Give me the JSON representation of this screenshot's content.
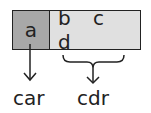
{
  "cells": {
    "car_cell": "a",
    "cdr_cell": "b c d"
  },
  "labels": {
    "car": "car",
    "cdr": "cdr"
  },
  "colors": {
    "car_fill": "#a8a8a8",
    "cdr_fill": "#e0e0e0",
    "stroke": "#222222"
  }
}
